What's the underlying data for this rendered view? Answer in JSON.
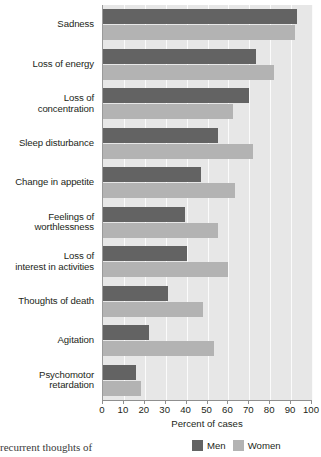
{
  "chart_data": {
    "type": "bar",
    "orientation": "horizontal",
    "title": "",
    "xlabel": "Percent of cases",
    "ylabel": "",
    "xlim": [
      0,
      100
    ],
    "xticks": [
      0,
      10,
      20,
      30,
      40,
      50,
      60,
      70,
      80,
      90,
      100
    ],
    "grid": true,
    "grid_axis": "x",
    "legend_position": "bottom-right",
    "categories": [
      "Sadness",
      "Loss of energy",
      "Loss of concentration",
      "Sleep disturbance",
      "Change in appetite",
      "Feelings of worthlessness",
      "Loss of interest in activities",
      "Thoughts of death",
      "Agitation",
      "Psychomotor retardation"
    ],
    "category_label_lines": [
      [
        "Sadness"
      ],
      [
        "Loss of energy"
      ],
      [
        "Loss of",
        "concentration"
      ],
      [
        "Sleep disturbance"
      ],
      [
        "Change in appetite"
      ],
      [
        "Feelings of",
        "worthlessness"
      ],
      [
        "Loss of",
        "interest in activities"
      ],
      [
        "Thoughts of death"
      ],
      [
        "Agitation"
      ],
      [
        "Psychomotor",
        "retardation"
      ]
    ],
    "series": [
      {
        "name": "Men",
        "color": "#636363",
        "values": [
          93,
          73,
          70,
          55,
          47,
          39,
          40,
          31,
          22,
          16
        ]
      },
      {
        "name": "Women",
        "color": "#b3b3b3",
        "values": [
          92,
          82,
          62,
          72,
          63,
          55,
          60,
          48,
          53,
          18
        ]
      }
    ]
  },
  "axis": {
    "x_title": "Percent of cases",
    "tick_labels": [
      "0",
      "10",
      "20",
      "30",
      "40",
      "50",
      "60",
      "70",
      "80",
      "90",
      "100"
    ]
  },
  "legend": {
    "items": [
      {
        "label": "Men",
        "color": "#636363"
      },
      {
        "label": "Women",
        "color": "#b3b3b3"
      }
    ]
  },
  "page_text": {
    "fragment": "recurrent thoughts of"
  },
  "colors": {
    "men": "#636363",
    "women": "#b3b3b3",
    "plot_background": "#e7e7e7",
    "gridline": "#fbfbfb",
    "axis": "#8f8f8f",
    "text": "#231f20"
  }
}
